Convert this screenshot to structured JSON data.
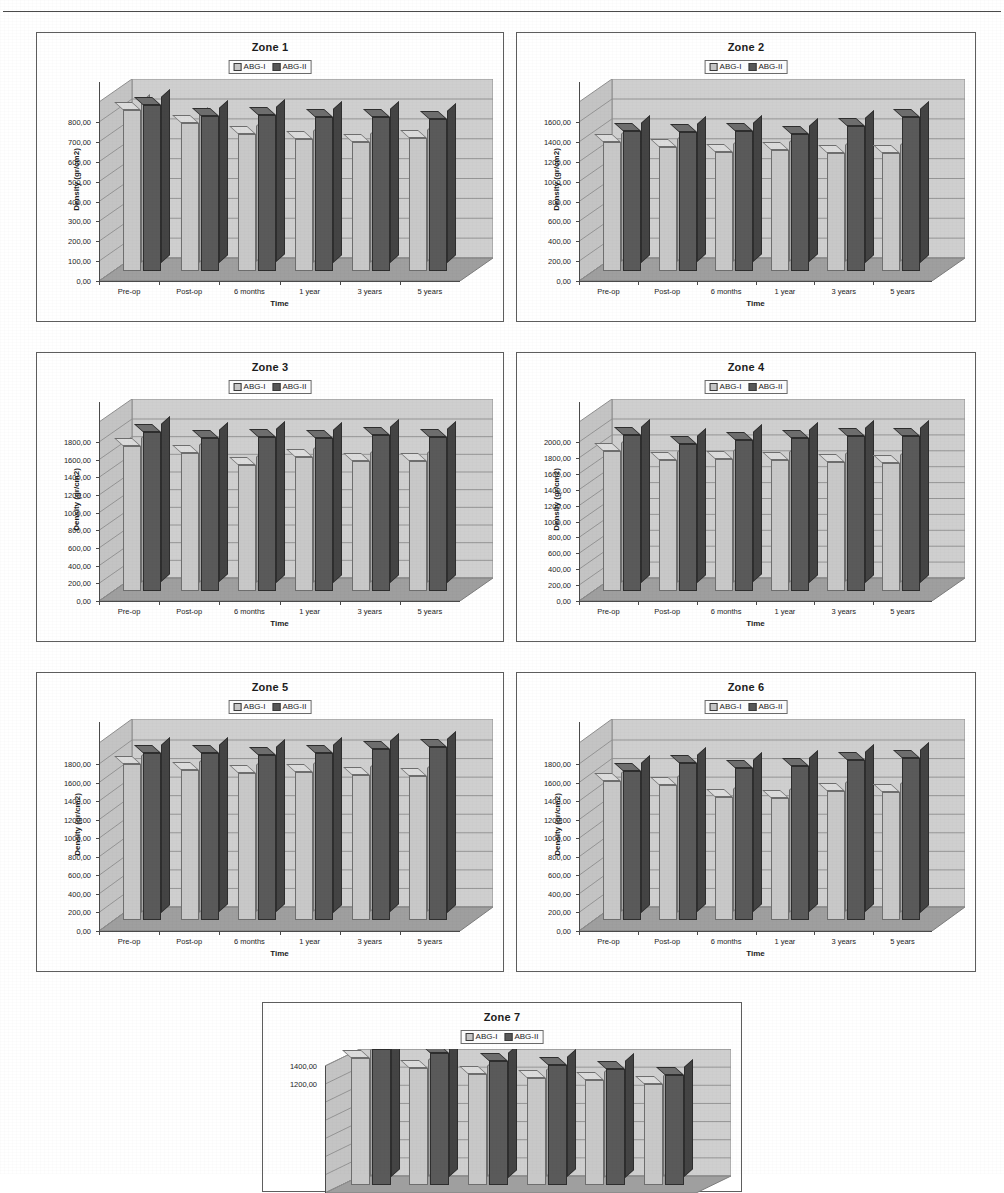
{
  "page": {
    "running_head": "",
    "background": "#ffffff"
  },
  "legend": {
    "series_a": "ABG-I",
    "series_b": "ABG-II",
    "color_a": "#c8c8c8",
    "color_b": "#5a5a5a"
  },
  "axes": {
    "xlabel": "Time",
    "ylabel": "Density (gr/cm2)",
    "categories": [
      "Pre-op",
      "Post-op",
      "6 months",
      "1 year",
      "3 years",
      "5 years"
    ]
  },
  "chart_data": [
    {
      "type": "bar",
      "title": "Zone 1",
      "xlabel": "Time",
      "ylabel": "Density (gr/cm2)",
      "categories": [
        "Pre-op",
        "Post-op",
        "6 months",
        "1 year",
        "3 years",
        "5 years"
      ],
      "ylim": [
        0,
        800
      ],
      "ystep": 100,
      "yticks": [
        "0,00",
        "100,00",
        "200,00",
        "300,00",
        "400,00",
        "500,00",
        "600,00",
        "700,00",
        "800,00"
      ],
      "grid": true,
      "legend_position": "top-center",
      "series": [
        {
          "name": "ABG-I",
          "values": [
            745,
            680,
            622,
            598,
            585,
            602
          ]
        },
        {
          "name": "ABG-II",
          "values": [
            770,
            715,
            718,
            710,
            712,
            700
          ]
        }
      ]
    },
    {
      "type": "bar",
      "title": "Zone 2",
      "xlabel": "Time",
      "ylabel": "Density (gr/cm2)",
      "categories": [
        "Pre-op",
        "Post-op",
        "6 months",
        "1 year",
        "3 years",
        "5 years"
      ],
      "ylim": [
        0,
        1600
      ],
      "ystep": 200,
      "yticks": [
        "0,00",
        "200,00",
        "400,00",
        "600,00",
        "800,00",
        "1000,00",
        "1200,00",
        "1400,00",
        "1600,00"
      ],
      "grid": true,
      "legend_position": "top-center",
      "series": [
        {
          "name": "ABG-I",
          "values": [
            1165,
            1115,
            1065,
            1085,
            1055,
            1055
          ]
        },
        {
          "name": "ABG-II",
          "values": [
            1280,
            1265,
            1275,
            1245,
            1330,
            1420
          ]
        }
      ]
    },
    {
      "type": "bar",
      "title": "Zone 3",
      "xlabel": "Time",
      "ylabel": "Density (gr/cm2)",
      "categories": [
        "Pre-op",
        "Post-op",
        "6 months",
        "1 year",
        "3 years",
        "5 years"
      ],
      "ylim": [
        0,
        1800
      ],
      "ystep": 200,
      "yticks": [
        "0,00",
        "200,00",
        "400,00",
        "600,00",
        "800,00",
        "1000,00",
        "1200,00",
        "1400,00",
        "1600,00",
        "1800,00"
      ],
      "grid": true,
      "legend_position": "top-center",
      "series": [
        {
          "name": "ABG-I",
          "values": [
            1495,
            1415,
            1285,
            1370,
            1325,
            1330
          ]
        },
        {
          "name": "ABG-II",
          "values": [
            1650,
            1580,
            1595,
            1590,
            1620,
            1595
          ]
        }
      ]
    },
    {
      "type": "bar",
      "title": "Zone 4",
      "xlabel": "Time",
      "ylabel": "Density (gr/cm2)",
      "categories": [
        "Pre-op",
        "Post-op",
        "6 months",
        "1 year",
        "3 years",
        "5 years"
      ],
      "ylim": [
        0,
        2000
      ],
      "ystep": 200,
      "yticks": [
        "0,00",
        "200,00",
        "400,00",
        "600,00",
        "800,00",
        "1000,00",
        "1200,00",
        "1400,00",
        "1600,00",
        "1800,00",
        "2000,00"
      ],
      "grid": true,
      "legend_position": "top-center",
      "series": [
        {
          "name": "ABG-I",
          "values": [
            1600,
            1490,
            1495,
            1490,
            1455,
            1450
          ]
        },
        {
          "name": "ABG-II",
          "values": [
            1800,
            1690,
            1730,
            1765,
            1790,
            1785
          ]
        }
      ]
    },
    {
      "type": "bar",
      "title": "Zone 5",
      "xlabel": "Time",
      "ylabel": "Density (gr/cm2)",
      "categories": [
        "Pre-op",
        "Post-op",
        "6 months",
        "1 year",
        "3 years",
        "5 years"
      ],
      "ylim": [
        0,
        1800
      ],
      "ystep": 200,
      "yticks": [
        "0,00",
        "200,00",
        "400,00",
        "600,00",
        "800,00",
        "1000,00",
        "1200,00",
        "1400,00",
        "1600,00",
        "1800,00"
      ],
      "grid": true,
      "legend_position": "top-center",
      "series": [
        {
          "name": "ABG-I",
          "values": [
            1545,
            1480,
            1440,
            1450,
            1420,
            1410
          ]
        },
        {
          "name": "ABG-II",
          "values": [
            1665,
            1660,
            1640,
            1665,
            1700,
            1730
          ]
        }
      ]
    },
    {
      "type": "bar",
      "title": "Zone 6",
      "xlabel": "Time",
      "ylabel": "Density (gr/cm2)",
      "categories": [
        "Pre-op",
        "Post-op",
        "6 months",
        "1 year",
        "3 years",
        "5 years"
      ],
      "ylim": [
        0,
        1800
      ],
      "ystep": 200,
      "yticks": [
        "0,00",
        "200,00",
        "400,00",
        "600,00",
        "800,00",
        "1000,00",
        "1200,00",
        "1400,00",
        "1600,00",
        "1800,00"
      ],
      "grid": true,
      "legend_position": "top-center",
      "series": [
        {
          "name": "ABG-I",
          "values": [
            1355,
            1320,
            1185,
            1180,
            1250,
            1245
          ]
        },
        {
          "name": "ABG-II",
          "values": [
            1470,
            1555,
            1500,
            1520,
            1580,
            1610
          ]
        }
      ]
    },
    {
      "type": "bar",
      "title": "Zone 7",
      "xlabel": "Time",
      "ylabel": "Density (gr/cm2)",
      "categories": [
        "Pre-op",
        "Post-op",
        "6 months",
        "1 year",
        "3 years",
        "5 years"
      ],
      "ylim": [
        0,
        1400
      ],
      "ystep": 200,
      "yticks": [
        "1200,00",
        "1400,00"
      ],
      "grid": true,
      "legend_position": "top-center",
      "cropped": true,
      "series": [
        {
          "name": "ABG-I",
          "values": [
            1300,
            1190,
            1120,
            1080,
            1060,
            1010
          ]
        },
        {
          "name": "ABG-II",
          "values": [
            1400,
            1355,
            1270,
            1225,
            1185,
            1115
          ]
        }
      ]
    }
  ]
}
